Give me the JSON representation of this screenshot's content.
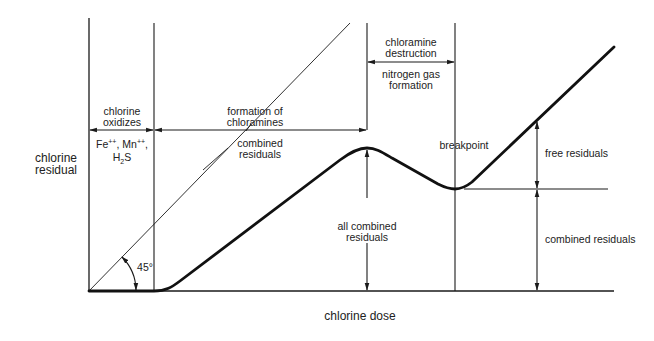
{
  "diagram": {
    "type": "breakpoint chlorination curve",
    "y_axis_label_line1": "chlorine",
    "y_axis_label_line2": "residual",
    "x_axis_label": "chlorine dose",
    "zones": {
      "zone1_line1": "chlorine",
      "zone1_line2": "oxidizes",
      "zone1_species_fe": "Fe",
      "zone1_species_fe_charge": "++",
      "zone1_species_mn": "Mn",
      "zone1_species_mn_charge": "++",
      "zone1_species_h": "H",
      "zone1_species_h_sub": "2",
      "zone1_species_s": "S",
      "zone2_line1": "formation of",
      "zone2_line2": "chloramines",
      "zone2_sub_line1": "combined",
      "zone2_sub_line2": "residuals",
      "zone3_line1": "chloramine",
      "zone3_line2": "destruction",
      "zone3_sub_line1": "nitrogen gas",
      "zone3_sub_line2": "formation"
    },
    "annotations": {
      "angle": "45°",
      "all_combined_line1": "all combined",
      "all_combined_line2": "residuals",
      "breakpoint": "breakpoint",
      "free_residuals": "free residuals",
      "combined_residuals": "combined residuals"
    },
    "colors": {
      "line": "#1a1a1a",
      "background": "#ffffff"
    }
  }
}
